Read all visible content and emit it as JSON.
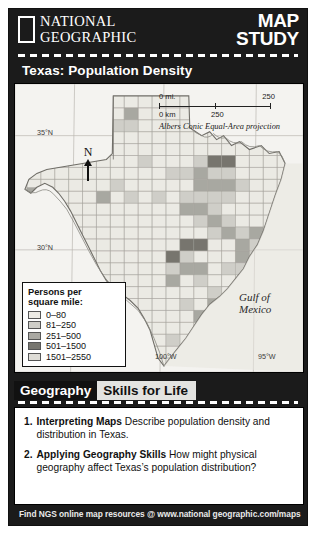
{
  "brand": {
    "line1": "NATIONAL",
    "line2": "GEOGRAPHIC",
    "feature_line1": "MAP",
    "feature_line2": "STUDY"
  },
  "map": {
    "title": "Texas: Population Density",
    "latitude_labels": [
      "35°N",
      "30°N"
    ],
    "longitude_labels": [
      "100°W",
      "95°W"
    ],
    "water_label": "Gulf of\nMexico",
    "water_label_line1": "Gulf of",
    "water_label_line2": "Mexico",
    "north_arrow_letter": "N",
    "scale": {
      "miles_start": "0 mi.",
      "miles_end": "250",
      "km_start": "0 km",
      "km_mid": "250",
      "projection": "Albers Conic Equal-Area projection"
    },
    "legend": {
      "title_line1": "Persons per",
      "title_line2": "square mile:",
      "classes": [
        {
          "label": "0–80",
          "color": "#eceae4"
        },
        {
          "label": "81–250",
          "color": "#cfcec8"
        },
        {
          "label": "251–500",
          "color": "#a9a8a2"
        },
        {
          "label": "501–1500",
          "color": "#77766f"
        },
        {
          "label": "1501–2550",
          "color": "#dedcd6"
        }
      ]
    }
  },
  "skills": {
    "tab_dark": "Geography",
    "tab_light": "Skills for Life",
    "questions": [
      {
        "number": "1.",
        "bold": "Interpreting Maps",
        "text": "Describe population density and distribution in Texas."
      },
      {
        "number": "2.",
        "bold": "Applying Geography Skills",
        "text": "How might physical geography affect Texas’s population distribution?"
      }
    ]
  },
  "footer": {
    "text": "Find NGS online map resources @ www.national geographic.com/maps"
  },
  "colors": {
    "frame": "#1b1b1b",
    "map_bg": "#f4f3f0",
    "tab_light": "#e3e3e0"
  }
}
